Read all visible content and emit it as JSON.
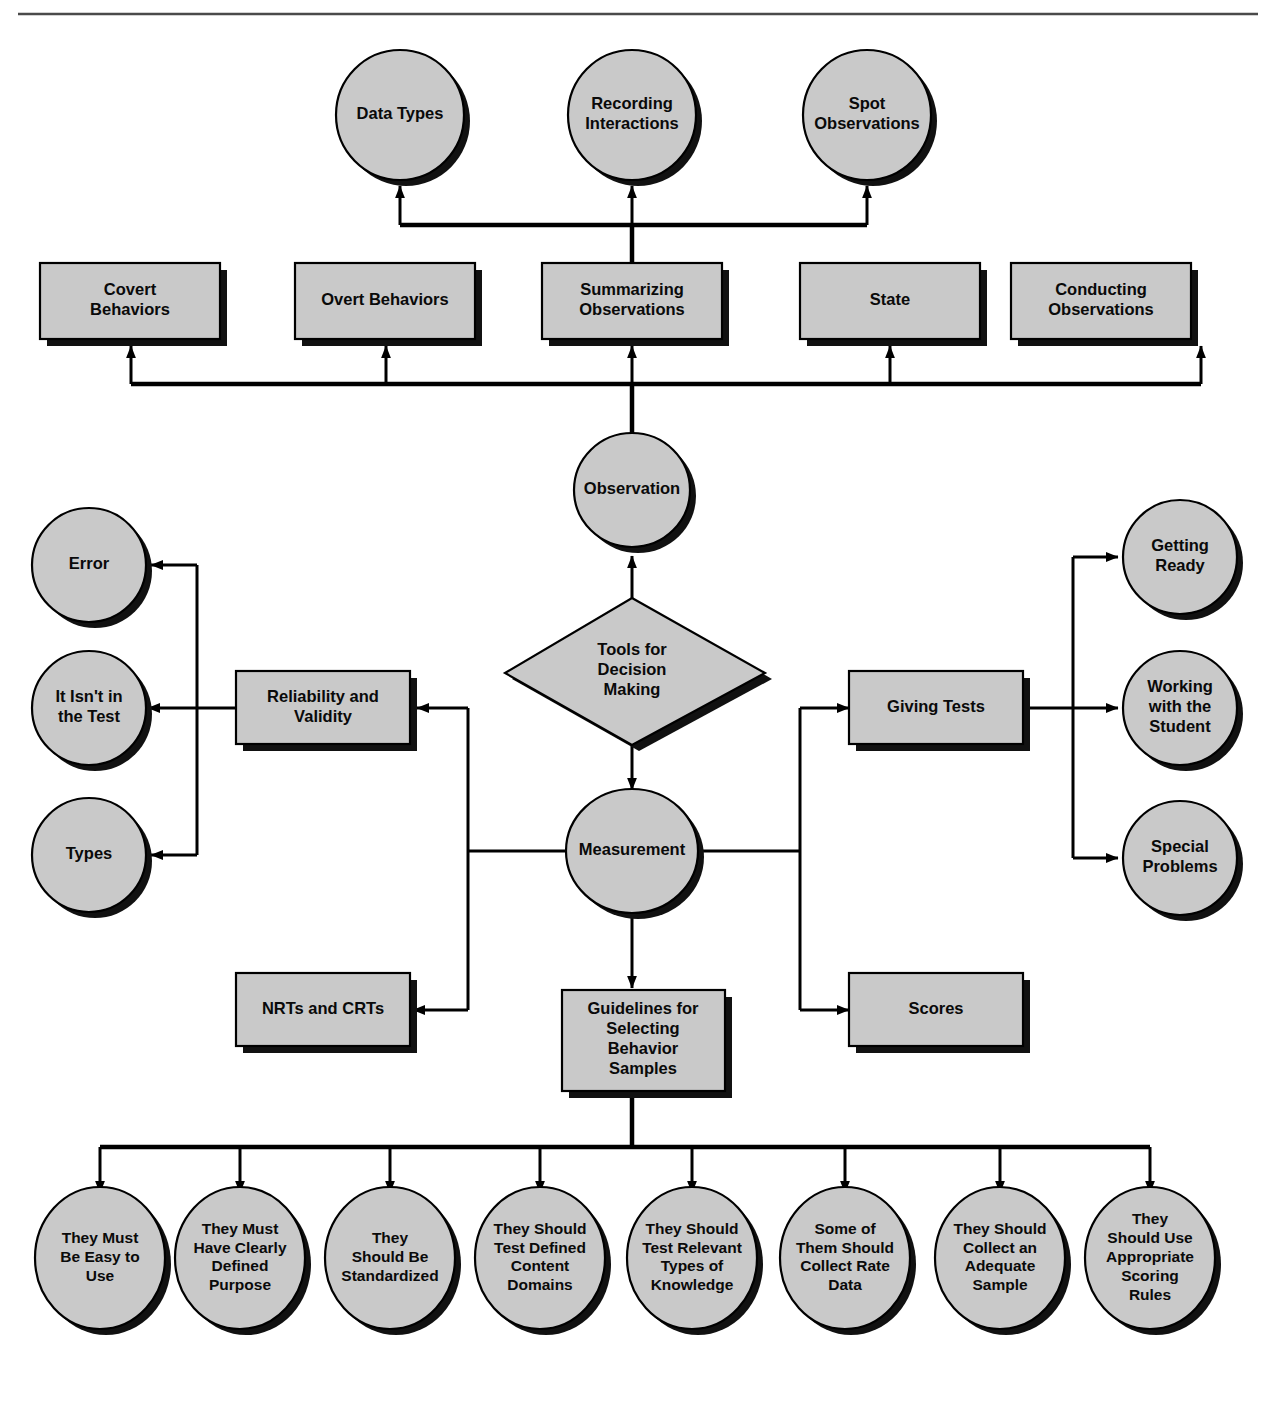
{
  "diagram": {
    "colors": {
      "shape_fill": "#c9c9c9",
      "shape_stroke": "#000000",
      "shadow": "#111111",
      "connector": "#000000",
      "background": "#ffffff",
      "rule": "#4a4a4a"
    },
    "root": {
      "label": "Tools for\nDecision\nMaking",
      "shape": "diamond"
    },
    "branches": {
      "observation": {
        "label": "Observation",
        "shape": "circle",
        "children_boxes": [
          {
            "label": "Covert\nBehaviors",
            "shape": "box"
          },
          {
            "label": "Overt Behaviors",
            "shape": "box"
          },
          {
            "label": "Summarizing\nObservations",
            "shape": "box"
          },
          {
            "label": "State",
            "shape": "box"
          },
          {
            "label": "Conducting\nObservations",
            "shape": "box"
          }
        ],
        "summarizing_children": [
          {
            "label": "Data Types",
            "shape": "circle"
          },
          {
            "label": "Recording\nInteractions",
            "shape": "circle"
          },
          {
            "label": "Spot\nObservations",
            "shape": "circle"
          }
        ]
      },
      "measurement": {
        "label": "Measurement",
        "shape": "circle",
        "left_boxes": [
          {
            "label": "Reliability and\nValidity",
            "shape": "box"
          },
          {
            "label": "NRTs and CRTs",
            "shape": "box"
          }
        ],
        "reliability_children": [
          {
            "label": "Error",
            "shape": "circle"
          },
          {
            "label": "It Isn't in\nthe Test",
            "shape": "circle"
          },
          {
            "label": "Types",
            "shape": "circle"
          }
        ],
        "right_boxes": [
          {
            "label": "Giving Tests",
            "shape": "box"
          },
          {
            "label": "Scores",
            "shape": "box"
          }
        ],
        "giving_tests_children": [
          {
            "label": "Getting\nReady",
            "shape": "circle"
          },
          {
            "label": "Working\nwith the\nStudent",
            "shape": "circle"
          },
          {
            "label": "Special\nProblems",
            "shape": "circle"
          }
        ],
        "guidelines_box": {
          "label": "Guidelines for\nSelecting\nBehavior\nSamples",
          "shape": "box"
        },
        "guidelines_children": [
          {
            "label": "They Must\nBe Easy to\nUse",
            "shape": "circle"
          },
          {
            "label": "They Must\nHave Clearly\nDefined\nPurpose",
            "shape": "circle"
          },
          {
            "label": "They\nShould Be\nStandardized",
            "shape": "circle"
          },
          {
            "label": "They Should\nTest Defined\nContent\nDomains",
            "shape": "circle"
          },
          {
            "label": "They Should\nTest Relevant\nTypes of\nKnowledge",
            "shape": "circle"
          },
          {
            "label": "Some of\nThem Should\nCollect Rate\nData",
            "shape": "circle"
          },
          {
            "label": "They Should\nCollect an\nAdequate\nSample",
            "shape": "circle"
          },
          {
            "label": "They\nShould Use\nAppropriate\nScoring\nRules",
            "shape": "circle"
          }
        ]
      }
    }
  }
}
